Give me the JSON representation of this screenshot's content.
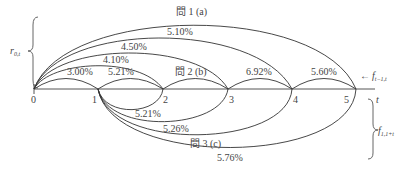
{
  "axis": {
    "label": "t",
    "ticks": [
      "0",
      "1",
      "2",
      "3",
      "4",
      "5"
    ]
  },
  "upper_arcs": [
    {
      "from": 0,
      "to": 1,
      "label": "3.00%"
    },
    {
      "from": 0,
      "to": 2,
      "label": "4.10%"
    },
    {
      "from": 0,
      "to": 3,
      "label": "4.50%"
    },
    {
      "from": 0,
      "to": 4,
      "label": "5.10%"
    },
    {
      "from": 0,
      "to": 5,
      "label": "問 1 (a)"
    }
  ],
  "forward_arcs": [
    {
      "from": 1,
      "to": 2,
      "label": "5.21%"
    },
    {
      "from": 2,
      "to": 3,
      "label": "問 2 (b)"
    },
    {
      "from": 3,
      "to": 4,
      "label": "6.92%"
    },
    {
      "from": 4,
      "to": 5,
      "label": "5.60%"
    }
  ],
  "lower_arcs": [
    {
      "from": 1,
      "to": 2,
      "label": "5.21%"
    },
    {
      "from": 1,
      "to": 3,
      "label": "5.26%"
    },
    {
      "from": 1,
      "to": 4,
      "label": "問 3 (c)"
    },
    {
      "from": 1,
      "to": 5,
      "label": "5.76%"
    }
  ],
  "annotations": {
    "spot_rate": {
      "main": "r",
      "sub": "0,t"
    },
    "forward_rate": {
      "arrow": "←",
      "main": "f",
      "sub": "t−1,t"
    },
    "forward_from_1": {
      "main": "f",
      "sub": "1,1+t"
    }
  }
}
